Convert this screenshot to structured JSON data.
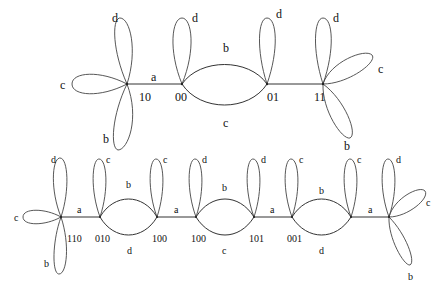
{
  "top_graph": {
    "nodes": [
      {
        "id": "10",
        "label": "10",
        "x": 127,
        "y": 84
      },
      {
        "id": "00",
        "label": "00",
        "x": 182,
        "y": 84
      },
      {
        "id": "01",
        "label": "01",
        "x": 267,
        "y": 84
      },
      {
        "id": "11",
        "label": "11",
        "x": 323,
        "y": 84
      }
    ],
    "edges": [
      {
        "from": "10",
        "to": "00",
        "label": "a"
      },
      {
        "from": "00",
        "to": "01",
        "label": "b",
        "side": "upper"
      },
      {
        "from": "00",
        "to": "01",
        "label": "c",
        "side": "lower"
      },
      {
        "from": "01",
        "to": "11",
        "label": ""
      }
    ],
    "loops": [
      {
        "node": "10",
        "label": "d",
        "direction": "up"
      },
      {
        "node": "10",
        "label": "c",
        "direction": "left"
      },
      {
        "node": "10",
        "label": "b",
        "direction": "down"
      },
      {
        "node": "00",
        "label": "d",
        "direction": "up"
      },
      {
        "node": "01",
        "label": "d",
        "direction": "up"
      },
      {
        "node": "11",
        "label": "d",
        "direction": "up"
      },
      {
        "node": "11",
        "label": "c",
        "direction": "up-right"
      },
      {
        "node": "11",
        "label": "b",
        "direction": "down-right"
      }
    ]
  },
  "bottom_graph": {
    "nodes": [
      {
        "id": "n1",
        "label": "110",
        "x": 61,
        "y": 217
      },
      {
        "id": "n2",
        "label": "010",
        "x": 100,
        "y": 217
      },
      {
        "id": "n3",
        "label": "100",
        "x": 157,
        "y": 217
      },
      {
        "id": "n4",
        "label": "100",
        "x": 196,
        "y": 217
      },
      {
        "id": "n5",
        "label": "101",
        "x": 254,
        "y": 217
      },
      {
        "id": "n6",
        "label": "001",
        "x": 292,
        "y": 217
      },
      {
        "id": "n7",
        "label": "",
        "x": 351,
        "y": 217
      },
      {
        "id": "n8",
        "label": "",
        "x": 389,
        "y": 217
      }
    ],
    "edges": [
      {
        "from": "n1",
        "to": "n2",
        "label": "a"
      },
      {
        "from": "n2",
        "to": "n3",
        "label": "b",
        "side": "upper"
      },
      {
        "from": "n2",
        "to": "n3",
        "label": "d",
        "side": "lower"
      },
      {
        "from": "n3",
        "to": "n4",
        "label": "a"
      },
      {
        "from": "n4",
        "to": "n5",
        "label": "b",
        "side": "upper"
      },
      {
        "from": "n4",
        "to": "n5",
        "label": "c",
        "side": "lower"
      },
      {
        "from": "n5",
        "to": "n6",
        "label": "a"
      },
      {
        "from": "n6",
        "to": "n7",
        "label": "b",
        "side": "upper"
      },
      {
        "from": "n6",
        "to": "n7",
        "label": "d",
        "side": "lower"
      },
      {
        "from": "n7",
        "to": "n8",
        "label": "a"
      }
    ],
    "loops": [
      {
        "node": "n1",
        "label": "d",
        "direction": "up"
      },
      {
        "node": "n1",
        "label": "c",
        "direction": "left"
      },
      {
        "node": "n1",
        "label": "b",
        "direction": "down"
      },
      {
        "node": "n2",
        "label": "c",
        "direction": "up"
      },
      {
        "node": "n3",
        "label": "c",
        "direction": "up"
      },
      {
        "node": "n4",
        "label": "d",
        "direction": "up"
      },
      {
        "node": "n5",
        "label": "d",
        "direction": "up"
      },
      {
        "node": "n6",
        "label": "c",
        "direction": "up"
      },
      {
        "node": "n7",
        "label": "c",
        "direction": "up"
      },
      {
        "node": "n8",
        "label": "d",
        "direction": "up"
      },
      {
        "node": "n8",
        "label": "c",
        "direction": "up-right"
      },
      {
        "node": "n8",
        "label": "b",
        "direction": "down-right"
      }
    ]
  },
  "text": {
    "t_10": "10",
    "t_00": "00",
    "t_01": "01",
    "t_11": "11",
    "t_a": "a",
    "t_b": "b",
    "t_c": "c",
    "t_d": "d",
    "b_110": "110",
    "b_010": "010",
    "b_100a": "100",
    "b_100b": "100",
    "b_101": "101",
    "b_001": "001"
  }
}
